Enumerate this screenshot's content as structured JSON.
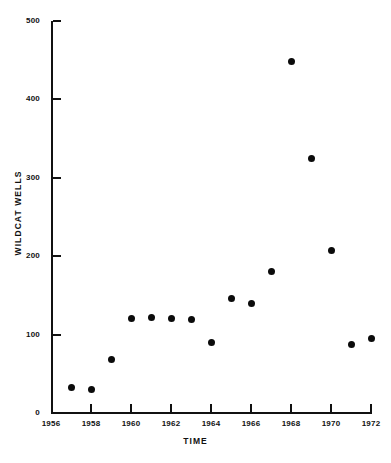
{
  "chart_data": {
    "type": "scatter",
    "title": "",
    "xlabel": "TIME",
    "ylabel": "WILDCAT WELLS",
    "xlim": [
      1956,
      1972
    ],
    "ylim": [
      0,
      500
    ],
    "grid": false,
    "legend": null,
    "marker": "filled-circle",
    "marker_color": "#0b0b0b",
    "x_ticks": [
      1956,
      1958,
      1960,
      1962,
      1964,
      1966,
      1968,
      1970,
      1972
    ],
    "x_tick_labels": [
      "1956",
      "1958",
      "1960",
      "1962",
      "1964",
      "1966",
      "1968",
      "1970",
      "1972"
    ],
    "y_ticks": [
      0,
      100,
      200,
      300,
      400,
      500
    ],
    "y_tick_labels": [
      "0",
      "100",
      "200",
      "300",
      "400",
      "500"
    ],
    "x": [
      1957,
      1958,
      1959,
      1960,
      1961,
      1962,
      1963,
      1964,
      1965,
      1966,
      1967,
      1968,
      1969,
      1970,
      1971,
      1972
    ],
    "values": [
      33,
      30,
      68,
      120,
      122,
      120,
      119,
      90,
      146,
      140,
      180,
      448,
      324,
      207,
      87,
      95
    ],
    "points": [
      {
        "x": 1957,
        "y": 33
      },
      {
        "x": 1958,
        "y": 30
      },
      {
        "x": 1959,
        "y": 68
      },
      {
        "x": 1960,
        "y": 120
      },
      {
        "x": 1961,
        "y": 122
      },
      {
        "x": 1962,
        "y": 120
      },
      {
        "x": 1963,
        "y": 119
      },
      {
        "x": 1964,
        "y": 90
      },
      {
        "x": 1965,
        "y": 146
      },
      {
        "x": 1966,
        "y": 140
      },
      {
        "x": 1967,
        "y": 180
      },
      {
        "x": 1968,
        "y": 448
      },
      {
        "x": 1969,
        "y": 324
      },
      {
        "x": 1970,
        "y": 207
      },
      {
        "x": 1971,
        "y": 87
      },
      {
        "x": 1972,
        "y": 95
      }
    ]
  }
}
